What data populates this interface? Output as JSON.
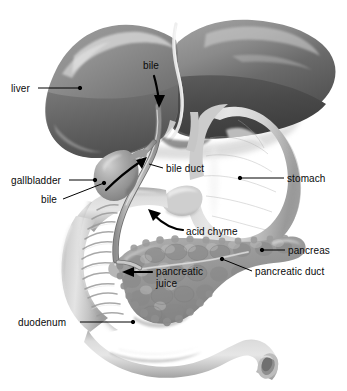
{
  "figure": {
    "background_color": "#ffffff",
    "width": 347,
    "height": 391
  },
  "palette": {
    "liver_left_lobe": "#8d8d8d",
    "liver_left_lobe_dark": "#6e6e6e",
    "liver_right_lobe": "#7c7c7c",
    "liver_right_lobe_dark": "#4f4f4f",
    "liver_highlight": "#d8d8d8",
    "falciform_ligament": "#e8e8e8",
    "stomach": "#c9c9c9",
    "stomach_shadow": "#a9a9a9",
    "stomach_highlight": "#eeeeee",
    "duodenum": "#c2c2c2",
    "duodenum_shadow": "#9b9b9b",
    "duodenum_fold": "#a0a0a0",
    "gallbladder": "#9e9e9e",
    "gallbladder_highlight": "#cfcfcf",
    "pancreas": "#9a9a9a",
    "pancreas_lobule": "#8a8a8a",
    "pancreas_highlight": "#c4c4c4",
    "duct": "#b4b4b4",
    "duct_outline": "#6f6f6f",
    "arrow": "#000000",
    "leader_line": "#000000",
    "label_text": "#0a0a0a"
  },
  "labels": [
    {
      "id": "liver",
      "text": "liver",
      "x": 11,
      "y": 83,
      "leader": {
        "from_x": 38,
        "from_y": 88,
        "to_x": 80,
        "to_y": 88,
        "dot": true
      }
    },
    {
      "id": "bile-top",
      "text": "bile",
      "x": 143,
      "y": 60,
      "arrow": "curved-down",
      "arrow_note": "curved arrow pointing down into the liver toward the hepatic duct"
    },
    {
      "id": "gallbladder",
      "text": "gallbladder",
      "x": 11,
      "y": 175,
      "leader": {
        "from_x": 69,
        "from_y": 180,
        "to_x": 95,
        "to_y": 180,
        "dot": true
      }
    },
    {
      "id": "bile-gallbladder",
      "text": "bile",
      "x": 41,
      "y": 194,
      "leader": {
        "from_x": 63,
        "from_y": 199,
        "to_x": 104,
        "to_y": 183,
        "dot": true
      }
    },
    {
      "id": "bile-duct",
      "text": "bile duct",
      "x": 166,
      "y": 163,
      "leader": {
        "from_x": 163,
        "from_y": 168,
        "to_x": 150,
        "to_y": 164,
        "dot": false
      }
    },
    {
      "id": "stomach",
      "text": "stomach",
      "x": 287,
      "y": 173,
      "leader": {
        "from_x": 284,
        "from_y": 178,
        "to_x": 240,
        "to_y": 178,
        "dot": true
      }
    },
    {
      "id": "acid-chyme",
      "text": "acid chyme",
      "x": 186,
      "y": 226,
      "arrow": "curved-up-left",
      "arrow_note": "curved arrow sweeping up and left from the label into the pylorus"
    },
    {
      "id": "pancreas",
      "text": "pancreas",
      "x": 288,
      "y": 245,
      "leader": {
        "from_x": 285,
        "from_y": 250,
        "to_x": 262,
        "to_y": 250,
        "dot": true
      }
    },
    {
      "id": "pancreatic-duct",
      "text": "pancreatic duct",
      "x": 255,
      "y": 266,
      "leader": {
        "from_x": 252,
        "from_y": 271,
        "to_x": 222,
        "to_y": 259,
        "dot": true
      }
    },
    {
      "id": "pancreatic-juice",
      "text": "pancreatic juice",
      "x": 156,
      "y": 266,
      "arrow": "straight-left",
      "arrow_note": "straight arrow pointing left from the label to the duodenal papilla"
    },
    {
      "id": "duodenum",
      "text": "duodenum",
      "x": 18,
      "y": 317,
      "leader": {
        "from_x": 80,
        "from_y": 322,
        "to_x": 133,
        "to_y": 322,
        "dot": true
      }
    }
  ],
  "organs": [
    {
      "id": "liver",
      "name": "liver"
    },
    {
      "id": "gallbladder",
      "name": "gallbladder"
    },
    {
      "id": "stomach",
      "name": "stomach"
    },
    {
      "id": "duodenum",
      "name": "duodenum"
    },
    {
      "id": "pancreas",
      "name": "pancreas"
    },
    {
      "id": "bile-duct",
      "name": "bile duct"
    },
    {
      "id": "pancreatic-duct",
      "name": "pancreatic duct"
    }
  ]
}
